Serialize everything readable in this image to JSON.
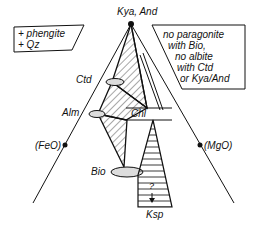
{
  "diagram": {
    "apex_label": "Kya, And",
    "left_label": "(FeO)",
    "right_label": "(MgO)",
    "phases": {
      "ctd": "Ctd",
      "alm": "Alm",
      "chl": "Chl",
      "bio": "Bio",
      "ksp": "Ksp",
      "unknown": "?"
    },
    "left_box": {
      "line1": "+ phengite",
      "line2": "+ Qz"
    },
    "right_box": {
      "line1": "no paragonite",
      "line2": "with Bio,",
      "line3": "no albite",
      "line4": "with Ctd",
      "line5": "or Kya/And"
    }
  }
}
